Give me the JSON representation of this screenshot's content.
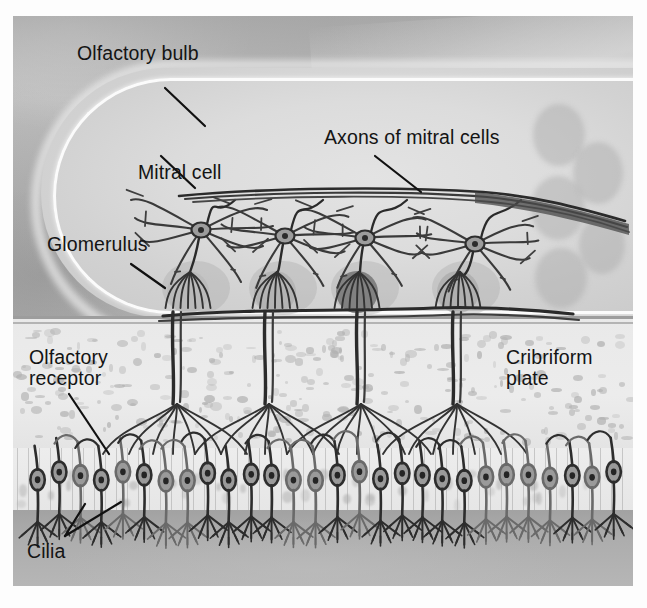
{
  "figure": {
    "type": "anatomical-diagram"
  },
  "labels": {
    "olfactory_bulb": "Olfactory bulb",
    "mitral_cell": "Mitral cell",
    "glomerulus": "Glomerulus",
    "axons_of_mitral_cells": "Axons of mitral cells",
    "olfactory_receptor": "Olfactory\nreceptor",
    "cribriform_plate": "Cribriform\nplate",
    "cilia": "Cilia"
  },
  "structures": {
    "olfactory_bulb": {
      "name": "Olfactory bulb",
      "mitral_cell_count": 4,
      "glomerulus_count": 4
    },
    "glomeruli": [
      {
        "index": 1,
        "shade": "light",
        "color": "#b4b4b4"
      },
      {
        "index": 2,
        "shade": "medium",
        "color": "#a8a8a8"
      },
      {
        "index": 3,
        "shade": "dark",
        "color": "#7d7d7d"
      },
      {
        "index": 4,
        "shade": "medium",
        "color": "#a0a0a0"
      }
    ],
    "cribriform_plate": {
      "name": "Cribriform plate",
      "texture": "mottled-bone"
    },
    "olfactory_epithelium": {
      "receptor_cell_count": 28,
      "layer": "epithelium"
    },
    "lamina_propria": {
      "name": "lamina propria",
      "color": "#adadad"
    }
  },
  "colors": {
    "background_upper": "#bdbdbd",
    "bulb_fill": "#dcdcdc",
    "bulb_rim": "#fbfbfb",
    "cribriform_fill": "#eaeaea",
    "epithelium_fill": "#ebebeb",
    "lamina_fill": "#adadad",
    "ink": "#2a2a2a",
    "label_text": "#141414",
    "page": "#ffffff"
  }
}
